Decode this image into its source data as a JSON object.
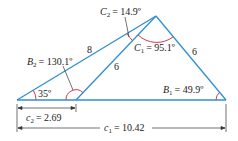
{
  "colors": {
    "line": "#2f8fd0",
    "arc": "#d63a4a",
    "dim": "#333333",
    "text": "#222222"
  },
  "vertices": {
    "A": [
      17,
      100
    ],
    "C_apex": [
      156,
      16
    ],
    "B2": [
      76,
      100
    ],
    "B1": [
      226,
      100
    ]
  },
  "labels": {
    "C2": {
      "var": "C",
      "sub": "2",
      "value": "= 14.9º"
    },
    "C1": {
      "var": "C",
      "sub": "1",
      "value": "= 95.1º"
    },
    "B2": {
      "var": "B",
      "sub": "2",
      "value": "= 130.1º"
    },
    "B1": {
      "var": "B",
      "sub": "1",
      "value": "= 49.9º"
    },
    "angleA": "35º",
    "side_long": "8",
    "side_inner": "6",
    "side_right": "6",
    "c2": {
      "var": "c",
      "sub": "2",
      "value": "= 2.69"
    },
    "c1": {
      "var": "c",
      "sub": "1",
      "value": "= 10.42"
    }
  }
}
